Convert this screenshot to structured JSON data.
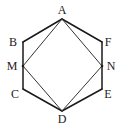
{
  "diagram": {
    "title": "",
    "points": [
      {
        "id": "A",
        "label": "A"
      },
      {
        "id": "B",
        "label": "B"
      },
      {
        "id": "M",
        "label": "M"
      },
      {
        "id": "C",
        "label": "C"
      },
      {
        "id": "D",
        "label": "D"
      },
      {
        "id": "E",
        "label": "E"
      },
      {
        "id": "N",
        "label": "N"
      },
      {
        "id": "F",
        "label": "F"
      }
    ],
    "hexagon": [
      "A",
      "B",
      "C",
      "D",
      "E",
      "F"
    ],
    "inner_segments": [
      [
        "A",
        "M"
      ],
      [
        "M",
        "D"
      ],
      [
        "D",
        "N"
      ],
      [
        "N",
        "A"
      ]
    ]
  }
}
